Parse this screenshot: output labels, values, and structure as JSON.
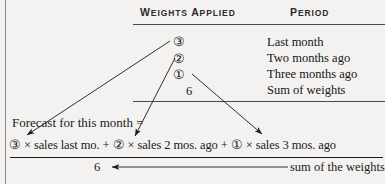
{
  "figure": {
    "type": "weighted-moving-average-formula-diagram",
    "background_color": "#f3f2f0",
    "ink_color": "#1a1a1a"
  },
  "table": {
    "headers": {
      "weights_applied": "WEIGHTS APPLIED",
      "period": "PERIOD"
    },
    "rows": [
      {
        "weight": "③",
        "weight_value": "3",
        "period": "Last month"
      },
      {
        "weight": "②",
        "weight_value": "2",
        "period": "Two months ago"
      },
      {
        "weight": "①",
        "weight_value": "1",
        "period": "Three months ago"
      },
      {
        "weight": "6",
        "weight_value": "6",
        "period": "Sum of weights"
      }
    ]
  },
  "formula": {
    "label": "Forecast for this month =",
    "numerator": "③ × sales last mo. + ② × sales 2 mos. ago + ① × sales 3 mos. ago",
    "numerator_parts": [
      "③",
      "×",
      "sales last mo.",
      "+",
      "②",
      "×",
      "sales 2 mos. ago",
      "+",
      "①",
      "×",
      "sales 3 mos. ago"
    ],
    "denominator": "6",
    "denominator_annotation": "sum of the weights"
  },
  "connectors": [
    {
      "name": "weight-3-to-numerator-term-1",
      "from": "③ in table",
      "to": "③ in numerator"
    },
    {
      "name": "weight-2-to-numerator-term-2",
      "from": "② in table",
      "to": "② in numerator"
    },
    {
      "name": "weight-1-to-numerator-term-3",
      "from": "① in table",
      "to": "① in numerator"
    },
    {
      "name": "sum-note-to-denominator",
      "from": "sum of the weights",
      "to": "6"
    }
  ]
}
